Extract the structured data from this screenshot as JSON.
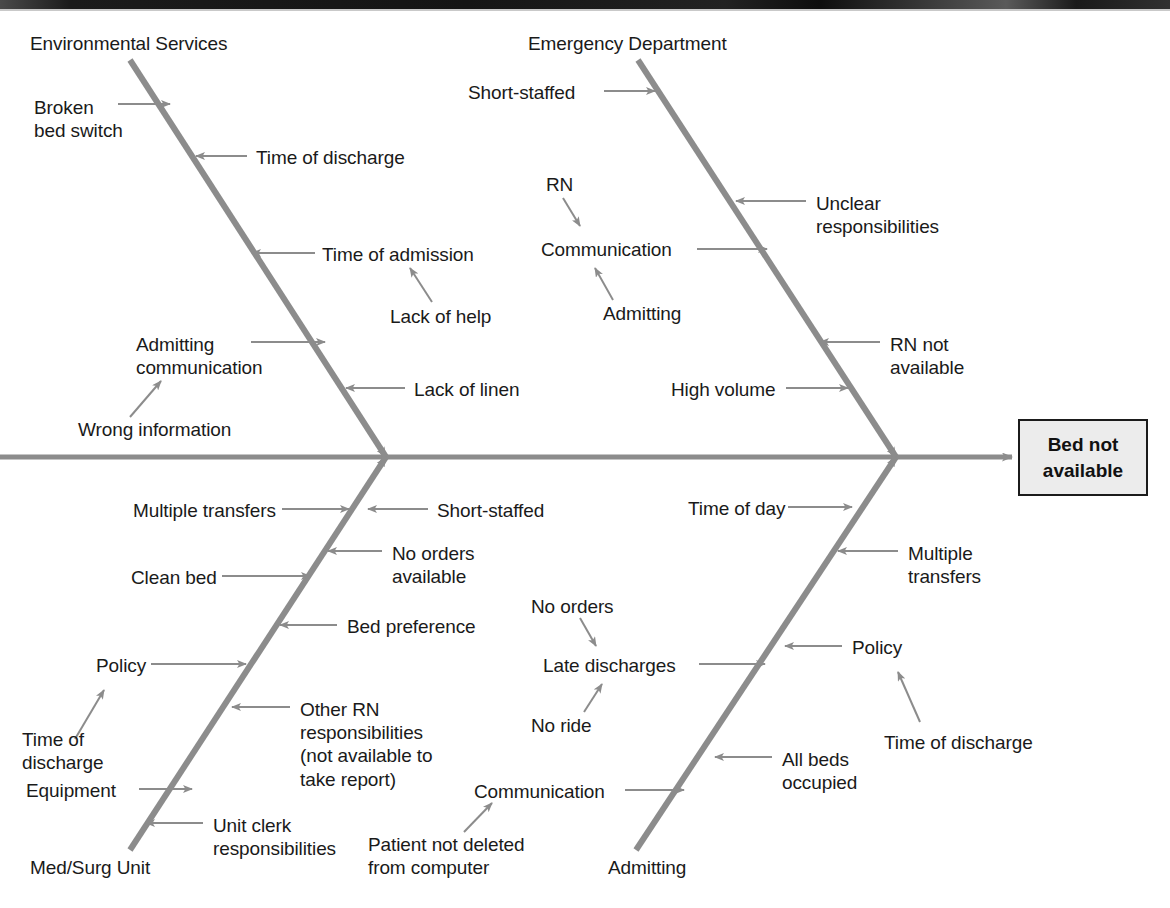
{
  "diagram": {
    "type": "fishbone-ishikawa",
    "effect": {
      "label": "Bed not\navailable",
      "box_fill": "#ececec",
      "box_stroke": "#1b1b1b"
    },
    "line_color": "#8c8c8c",
    "text_color": "#1a1a1a",
    "categories": [
      {
        "id": "environmental-services",
        "label": "Environmental Services",
        "position": "top-left",
        "causes": [
          {
            "label": "Broken\nbed switch",
            "sub_causes": []
          },
          {
            "label": "Time of discharge",
            "sub_causes": []
          },
          {
            "label": "Time of admission",
            "sub_causes": [
              "Lack of help"
            ]
          },
          {
            "label": "Admitting\ncommunication",
            "sub_causes": [
              "Wrong information"
            ]
          },
          {
            "label": "Lack of linen",
            "sub_causes": []
          }
        ]
      },
      {
        "id": "emergency-department",
        "label": "Emergency Department",
        "position": "top-right",
        "causes": [
          {
            "label": "Short-staffed",
            "sub_causes": []
          },
          {
            "label": "Unclear\nresponsibilities",
            "sub_causes": []
          },
          {
            "label": "Communication",
            "sub_causes": [
              "RN",
              "Admitting"
            ]
          },
          {
            "label": "RN not\navailable",
            "sub_causes": []
          },
          {
            "label": "High volume",
            "sub_causes": []
          }
        ]
      },
      {
        "id": "med-surg-unit",
        "label": "Med/Surg Unit",
        "position": "bottom-left",
        "causes": [
          {
            "label": "Multiple transfers",
            "sub_causes": []
          },
          {
            "label": "Short-staffed",
            "sub_causes": []
          },
          {
            "label": "No orders\navailable",
            "sub_causes": []
          },
          {
            "label": "Clean bed",
            "sub_causes": []
          },
          {
            "label": "Bed preference",
            "sub_causes": []
          },
          {
            "label": "Policy",
            "sub_causes": [
              "Time of\ndischarge"
            ]
          },
          {
            "label": "Other RN\nresponsibilities\n(not available to\ntake report)",
            "sub_causes": []
          },
          {
            "label": "Equipment",
            "sub_causes": []
          },
          {
            "label": "Unit clerk\nresponsibilities",
            "sub_causes": []
          }
        ]
      },
      {
        "id": "admitting",
        "label": "Admitting",
        "position": "bottom-right",
        "causes": [
          {
            "label": "Time of day",
            "sub_causes": []
          },
          {
            "label": "Multiple\ntransfers",
            "sub_causes": []
          },
          {
            "label": "Late discharges",
            "sub_causes": [
              "No orders",
              "No ride"
            ]
          },
          {
            "label": "Policy",
            "sub_causes": [
              "Time of discharge"
            ]
          },
          {
            "label": "All beds\noccupied",
            "sub_causes": []
          },
          {
            "label": "Communication",
            "sub_causes": [
              "Patient not deleted\nfrom computer"
            ]
          }
        ]
      }
    ]
  },
  "labels": {
    "env_services": "Environmental Services",
    "emergency_department": "Emergency Department",
    "med_surg_unit": "Med/Surg Unit",
    "admitting_cat": "Admitting",
    "broken_bed_switch": "Broken\nbed switch",
    "time_of_discharge_1": "Time of discharge",
    "time_of_admission": "Time of admission",
    "lack_of_help": "Lack of help",
    "admitting_communication": "Admitting\ncommunication",
    "wrong_information": "Wrong information",
    "lack_of_linen": "Lack of linen",
    "short_staffed_ed": "Short-staffed",
    "rn": "RN",
    "communication_ed": "Communication",
    "admitting_sub_ed": "Admitting",
    "unclear_responsibilities": "Unclear\nresponsibilities",
    "rn_not_available": "RN not\navailable",
    "high_volume": "High volume",
    "multiple_transfers_ms": "Multiple transfers",
    "short_staffed_ms": "Short-staffed",
    "no_orders_available": "No orders\navailable",
    "clean_bed": "Clean bed",
    "bed_preference": "Bed preference",
    "policy_ms": "Policy",
    "time_of_discharge_ms": "Time of\ndischarge",
    "other_rn_responsibilities": "Other RN\nresponsibilities\n(not available to\ntake report)",
    "equipment": "Equipment",
    "unit_clerk_responsibilities": "Unit clerk\nresponsibilities",
    "time_of_day": "Time of day",
    "multiple_transfers_ad": "Multiple\ntransfers",
    "no_orders_ad": "No orders",
    "late_discharges": "Late discharges",
    "no_ride": "No ride",
    "policy_ad": "Policy",
    "time_of_discharge_ad": "Time of discharge",
    "all_beds_occupied": "All beds\noccupied",
    "communication_ad": "Communication",
    "patient_not_deleted": "Patient not deleted\nfrom computer",
    "effect": "Bed not\navailable"
  }
}
